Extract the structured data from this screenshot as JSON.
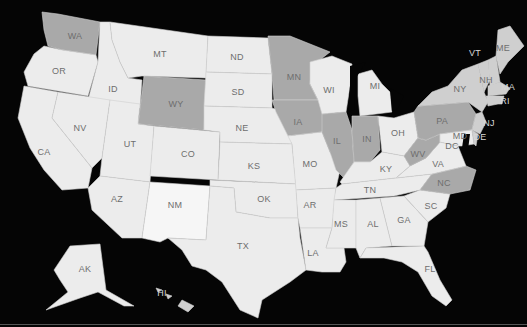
{
  "map": {
    "title": "United States",
    "colors": {
      "background": "#050505",
      "default_state": "#ececec",
      "light_state": "#f6f6f6",
      "highlighted_state": "#a9a9a9",
      "medium_state": "#cfcfcf",
      "border": "#d0d0d0",
      "label": "#6e6e6e"
    },
    "highlighted_states": [
      "WA",
      "WY",
      "MN",
      "IA",
      "IL",
      "IN",
      "PA",
      "WV",
      "NC"
    ],
    "medium_states": [
      "NY",
      "NH",
      "ME",
      "MA",
      "CT",
      "VT"
    ],
    "labels": {
      "WA": "WA",
      "OR": "OR",
      "CA": "CA",
      "ID": "ID",
      "NV": "NV",
      "MT": "MT",
      "WY": "WY",
      "UT": "UT",
      "AZ": "AZ",
      "CO": "CO",
      "NM": "NM",
      "ND": "ND",
      "SD": "SD",
      "NE": "NE",
      "KS": "KS",
      "OK": "OK",
      "TX": "TX",
      "MN": "MN",
      "IA": "IA",
      "MO": "MO",
      "AR": "AR",
      "LA": "LA",
      "WI": "WI",
      "IL": "IL",
      "MI": "MI",
      "IN": "IN",
      "OH": "OH",
      "KY": "KY",
      "TN": "TN",
      "MS": "MS",
      "AL": "AL",
      "GA": "GA",
      "FL": "FL",
      "SC": "SC",
      "NC": "NC",
      "VA": "VA",
      "WV": "WV",
      "PA": "PA",
      "NY": "NY",
      "VT": "VT",
      "NH": "NH",
      "ME": "ME",
      "MA": "MA",
      "RI": "RI",
      "CT": "CT",
      "NJ": "NJ",
      "DE": "DE",
      "MD": "MD",
      "DC": "DC",
      "AK": "AK",
      "HI": "HI"
    }
  }
}
